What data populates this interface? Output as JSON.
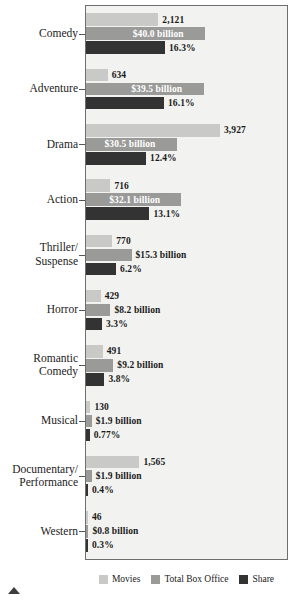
{
  "chart_data": {
    "type": "bar",
    "orientation": "horizontal",
    "title": "",
    "subtitle": "",
    "xlabel": "",
    "ylabel": "",
    "grid": false,
    "legend_position": "bottom",
    "categories": [
      "Comedy",
      "Adventure",
      "Drama",
      "Action",
      "Thriller/\nSuspense",
      "Horror",
      "Romantic\nComedy",
      "Musical",
      "Documentary/\nPerformance",
      "Western"
    ],
    "series": [
      {
        "name": "Movies",
        "color": "#c9c9c7",
        "values": [
          2121,
          634,
          3927,
          716,
          770,
          429,
          491,
          130,
          1565,
          46
        ],
        "labels": [
          "2,121",
          "634",
          "3,927",
          "716",
          "770",
          "429",
          "491",
          "130",
          "1,565",
          "46"
        ]
      },
      {
        "name": "Total Box Office",
        "color": "#9a9a98",
        "values": [
          40.0,
          39.5,
          30.5,
          32.1,
          15.3,
          8.2,
          9.2,
          1.9,
          1.9,
          0.8
        ],
        "labels": [
          "$40.0 billion",
          "$39.5 billion",
          "$30.5 billion",
          "$32.1 billion",
          "$15.3 billion",
          "$8.2 billion",
          "$9.2 billion",
          "$1.9 billion",
          "$1.9 billion",
          "$0.8 billion"
        ]
      },
      {
        "name": "Share",
        "color": "#333333",
        "values": [
          16.3,
          16.1,
          12.4,
          13.1,
          6.2,
          3.3,
          3.8,
          0.77,
          0.4,
          0.3
        ],
        "labels": [
          "16.3%",
          "16.1%",
          "12.4%",
          "13.1%",
          "6.2%",
          "3.3%",
          "3.8%",
          "0.77%",
          "0.4%",
          "0.3%"
        ]
      }
    ]
  },
  "legend": {
    "items": [
      {
        "label": "Movies",
        "color": "#c9c9c7"
      },
      {
        "label": "Total Box Office",
        "color": "#9a9a98"
      },
      {
        "label": "Share",
        "color": "#333333"
      }
    ]
  },
  "colors": {
    "plot_background": "#f2f2f0",
    "plot_border": "#6e6e6e",
    "page_background": "#ffffff",
    "text": "#1a1a1a",
    "marker": "#3d3d3d"
  }
}
